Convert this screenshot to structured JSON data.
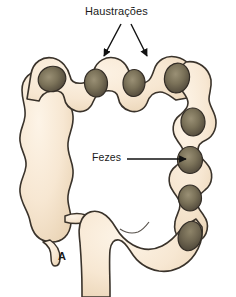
{
  "figure": {
    "panel_letter": "A",
    "background_color": "#ffffff"
  },
  "annotations": [
    {
      "id": "haustracoes",
      "label": "Haustrações",
      "icon": "arrow-down-left-icon",
      "points_to": "haustra-pouches-transverse-colon",
      "arrow_count": 2
    },
    {
      "id": "fezes",
      "label": "Fezes",
      "icon": "arrow-right-icon",
      "points_to": "fecal-mass-descending-colon",
      "arrow_count": 1
    }
  ],
  "colors": {
    "colon_wall_fill": "#f7e7d2",
    "colon_wall_fill_light": "#fdf4e7",
    "colon_wall_shadow": "#e6cfae",
    "colon_outline": "#3a332b",
    "feces_dark": "#4e463a",
    "feces_mid": "#736a55",
    "feces_light": "#8d8469",
    "feces_outline": "#3a332b",
    "annotation_text": "#1a1a1a",
    "arrow_stroke": "#111111"
  },
  "structures": [
    {
      "name": "transverse-colon",
      "feces_count": 4
    },
    {
      "name": "ascending-colon",
      "feces_count": 0
    },
    {
      "name": "descending-colon",
      "feces_count": 4
    },
    {
      "name": "cecum",
      "feces_count": 0
    },
    {
      "name": "vermiform-appendix",
      "feces_count": 0
    },
    {
      "name": "ileum-stub",
      "feces_count": 0
    },
    {
      "name": "sigmoid-colon",
      "feces_count": 0
    },
    {
      "name": "rectum",
      "feces_count": 1
    }
  ]
}
